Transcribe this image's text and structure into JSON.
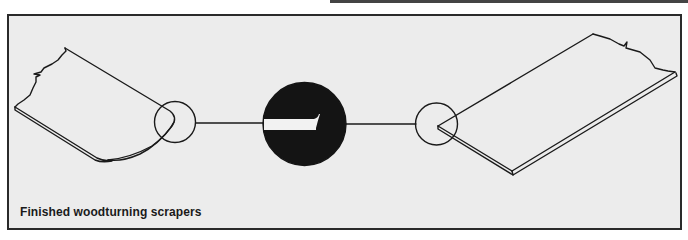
{
  "figure": {
    "caption": "Finished woodturning scrapers",
    "colors": {
      "panel_background": "#ececec",
      "line": "#1a1a1a",
      "detail_disk": "#141414",
      "detail_bevel": "#f2f2f2"
    },
    "elements": [
      {
        "id": "left-scraper",
        "description": "Scraper with rounded end"
      },
      {
        "id": "left-detail-circle",
        "description": "Detail marker on rounded tip"
      },
      {
        "id": "center-detail-disk",
        "description": "Enlarged edge profile showing bevel"
      },
      {
        "id": "right-detail-circle",
        "description": "Detail marker on square-end tip"
      },
      {
        "id": "right-scraper",
        "description": "Scraper with square/skew end"
      }
    ]
  }
}
